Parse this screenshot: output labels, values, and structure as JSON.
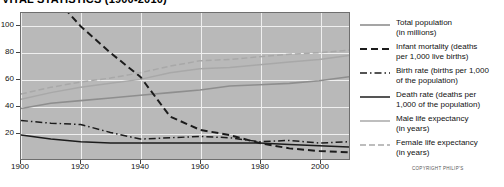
{
  "title": "VITAL STATISTICS (1900-2010)",
  "copyright": "COPYRIGHT PHILIP'S",
  "legend": {
    "items": [
      {
        "label_line1": "Total population",
        "label_line2": "(in millions)",
        "style": "solid-gray",
        "icon": "legend-line-icon"
      },
      {
        "label_line1": "Infant mortality (deaths",
        "label_line2": "per 1,000 live births)",
        "style": "dashed-dark",
        "icon": "legend-line-icon"
      },
      {
        "label_line1": "Birth rate (births per 1,000",
        "label_line2": "of the population)",
        "style": "dashdot-dark",
        "icon": "legend-line-icon"
      },
      {
        "label_line1": "Death rate (deaths per",
        "label_line2": "1,000 of the population)",
        "style": "solid-dark",
        "icon": "legend-line-icon"
      },
      {
        "label_line1": "Male life expectancy",
        "label_line2": "(in years)",
        "style": "solid-lightgray",
        "icon": "legend-line-icon"
      },
      {
        "label_line1": "Female life expectancy",
        "label_line2": "(in years)",
        "style": "dashed-lightgray",
        "icon": "legend-line-icon"
      }
    ]
  },
  "colors": {
    "plot_background": "#b9b9b9",
    "gridline": "#efefef",
    "frame": "#6f6f6f",
    "dark_line": "#1c1c1c",
    "mid_gray_line": "#8e8e8e",
    "light_gray_line": "#a8a8a8"
  },
  "chart_data": {
    "type": "line",
    "title": "VITAL STATISTICS (1900-2010)",
    "xlabel": "",
    "ylabel": "",
    "xlim": [
      1900,
      2010
    ],
    "ylim": [
      0,
      110
    ],
    "grid": true,
    "legend_position": "right",
    "xticks": [
      1900,
      1920,
      1940,
      1960,
      1980,
      2000
    ],
    "yticks": [
      20,
      40,
      60,
      80,
      100
    ],
    "x": [
      1900,
      1910,
      1920,
      1930,
      1940,
      1950,
      1960,
      1970,
      1980,
      1990,
      2000,
      2010
    ],
    "series": [
      {
        "name": "Total population (in millions)",
        "style": "solid-gray",
        "values": [
          38,
          42,
          44,
          46,
          48,
          50,
          52,
          55,
          56,
          57,
          59,
          62
        ]
      },
      {
        "name": "Infant mortality (deaths per 1,000 live births)",
        "style": "dashed-dark",
        "values": [
          150,
          125,
          100,
          80,
          62,
          32,
          22,
          18,
          12,
          8,
          6,
          5
        ]
      },
      {
        "name": "Birth rate (births per 1,000 of the population)",
        "style": "dashdot-dark",
        "values": [
          29,
          27,
          26,
          20,
          15,
          16,
          17,
          16,
          13,
          14,
          12,
          13
        ]
      },
      {
        "name": "Death rate (deaths per 1,000 of the population)",
        "style": "solid-dark",
        "values": [
          18,
          15,
          13,
          12,
          12,
          12,
          12,
          12,
          12,
          11,
          10,
          9
        ]
      },
      {
        "name": "Male life expectancy (in years)",
        "style": "solid-lightgray",
        "values": [
          45,
          50,
          54,
          57,
          60,
          65,
          68,
          69,
          71,
          73,
          75,
          78
        ]
      },
      {
        "name": "Female life expectancy (in years)",
        "style": "dashed-lightgray",
        "values": [
          49,
          54,
          58,
          61,
          65,
          70,
          74,
          75,
          77,
          79,
          80,
          82
        ]
      }
    ]
  }
}
